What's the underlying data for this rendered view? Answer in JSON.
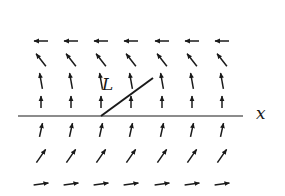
{
  "diagram": {
    "axis_label": "x",
    "line_label": "L",
    "colors": {
      "ink": "#1a1a1a",
      "background": "#ffffff"
    },
    "grid": {
      "columns_x": [
        41,
        71,
        101,
        131,
        162,
        192,
        222
      ],
      "rows": [
        {
          "y": 41,
          "angle_deg": 180,
          "length": 14,
          "note": "pointing left"
        },
        {
          "y": 60,
          "angle_deg": 128,
          "length": 16,
          "note": "pointing up-left"
        },
        {
          "y": 81,
          "angle_deg": 100,
          "length": 16,
          "note": "pointing up, slight left"
        },
        {
          "y": 102,
          "angle_deg": 90,
          "length": 12,
          "note": "pointing up (just above axis)"
        },
        {
          "y": 130,
          "angle_deg": 78,
          "length": 14,
          "note": "pointing up, slight right"
        },
        {
          "y": 156,
          "angle_deg": 55,
          "length": 16,
          "note": "pointing up-right"
        },
        {
          "y": 184,
          "angle_deg": 8,
          "length": 15,
          "note": "pointing right"
        }
      ]
    },
    "x_axis": {
      "y": 116,
      "x_start": 18,
      "x_end": 243
    },
    "segment_L": {
      "x1": 101,
      "y1": 116,
      "x2": 153,
      "y2": 78
    },
    "label_positions": {
      "L": {
        "x": 102,
        "y": 90
      },
      "x": {
        "x": 256,
        "y": 119
      }
    }
  }
}
